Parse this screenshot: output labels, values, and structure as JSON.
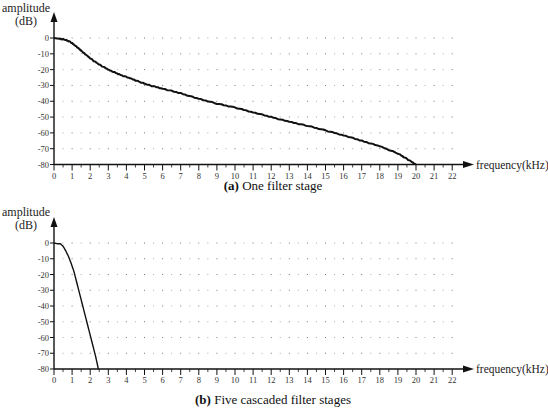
{
  "chart_data": [
    {
      "type": "line",
      "panel": "a",
      "caption_label": "(a)",
      "caption_text": "One filter stage",
      "ylabel_line1": "amplitude",
      "ylabel_line2": "(dB)",
      "xlabel": "frequency(kHz)",
      "xlim": [
        0,
        22
      ],
      "ylim": [
        -80,
        0
      ],
      "xticks": [
        0,
        1,
        2,
        3,
        4,
        5,
        6,
        7,
        8,
        9,
        10,
        11,
        12,
        13,
        14,
        15,
        16,
        17,
        18,
        19,
        20,
        21,
        22
      ],
      "yticks": [
        0,
        -10,
        -20,
        -30,
        -40,
        -50,
        -60,
        -70,
        -80
      ],
      "grid": "dotted",
      "series": [
        {
          "name": "One filter stage",
          "x": [
            0,
            0.3,
            0.6,
            0.9,
            1.2,
            1.5,
            1.8,
            2.2,
            2.6,
            3.1,
            3.6,
            4.2,
            4.8,
            5.3,
            6.0,
            7.0,
            8.0,
            9.0,
            10.0,
            11.0,
            12.0,
            13.0,
            14.0,
            15.0,
            16.0,
            17.0,
            18.0,
            19.0,
            19.5,
            20.0
          ],
          "y": [
            0,
            -0.5,
            -1,
            -2.5,
            -5,
            -8,
            -11,
            -14.5,
            -17.5,
            -20.5,
            -23,
            -25.5,
            -28,
            -30,
            -32,
            -35,
            -38.5,
            -41.5,
            -44,
            -47,
            -50,
            -53,
            -55.5,
            -58.5,
            -61.5,
            -65,
            -68.5,
            -73,
            -76.5,
            -80
          ]
        }
      ]
    },
    {
      "type": "line",
      "panel": "b",
      "caption_label": "(b)",
      "caption_text": "Five cascaded filter stages",
      "ylabel_line1": "amplitude",
      "ylabel_line2": "(dB)",
      "xlabel": "frequency(kHz)",
      "xlim": [
        0,
        22
      ],
      "ylim": [
        -80,
        0
      ],
      "xticks": [
        0,
        1,
        2,
        3,
        4,
        5,
        6,
        7,
        8,
        9,
        10,
        11,
        12,
        13,
        14,
        15,
        16,
        17,
        18,
        19,
        20,
        21,
        22
      ],
      "yticks": [
        0,
        -10,
        -20,
        -30,
        -40,
        -50,
        -60,
        -70,
        -80
      ],
      "grid": "dotted",
      "series": [
        {
          "name": "Five cascaded filter stages",
          "x": [
            0,
            0.2,
            0.35,
            0.5,
            0.65,
            0.8,
            0.95,
            1.1,
            1.3,
            1.5,
            1.7,
            1.9,
            2.1,
            2.3,
            2.45
          ],
          "y": [
            0,
            -0.5,
            -0.5,
            -2,
            -5,
            -8.5,
            -13,
            -18,
            -27,
            -36,
            -45,
            -54,
            -63,
            -72,
            -80
          ]
        }
      ]
    }
  ]
}
